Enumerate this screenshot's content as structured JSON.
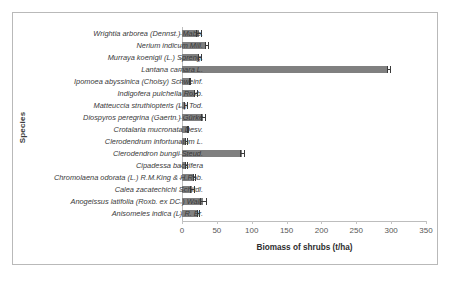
{
  "chart_data": {
    "type": "bar",
    "orientation": "horizontal",
    "title": "",
    "xlabel": "Biomass of shrubs  (t/ha)",
    "ylabel": "Species",
    "xlim": [
      0,
      350
    ],
    "xticks": [
      0,
      50,
      100,
      150,
      200,
      250,
      300,
      350
    ],
    "grid": false,
    "legend": null,
    "bar_color": "#808080",
    "error_bar_color": "#3a3a3a",
    "categories": [
      "Wrightia arborea (Dennst.) Mabb.",
      "Nerium indicum Mill.",
      "Murraya koenigii (L.) Spreng.",
      "Lantana camara L.",
      "Ipomoea abyssinica (Choisy) Schweinf.",
      "Indigofera pulchella Roxb.",
      "Matteuccia struthiopteris (L.) Tod.",
      "Diospyros peregrina (Gaertn.) Gürke",
      "Crotalaria mucronata Desv.",
      "Clerodendrum infortunatum L.",
      "Clerodendron bungii Steud.",
      "Cipadessa baccifera",
      "Chromolaena odorata (L.) R.M.King & H.Rob.",
      "Calea zacatechichi Schltdl.",
      "Anogeissus latifolia (Roxb. ex DC.) Wall.",
      "Anisomeles indica (L) R. Br."
    ],
    "values": [
      24,
      35,
      25,
      296,
      11,
      19,
      5,
      30,
      8,
      6,
      86,
      6,
      17,
      14,
      30,
      23
    ],
    "errors": [
      3.5,
      2.0,
      2.5,
      2.5,
      1.0,
      2.0,
      1.5,
      3.0,
      1.0,
      1.0,
      2.5,
      1.0,
      1.5,
      3.0,
      4.0,
      2.0
    ]
  }
}
